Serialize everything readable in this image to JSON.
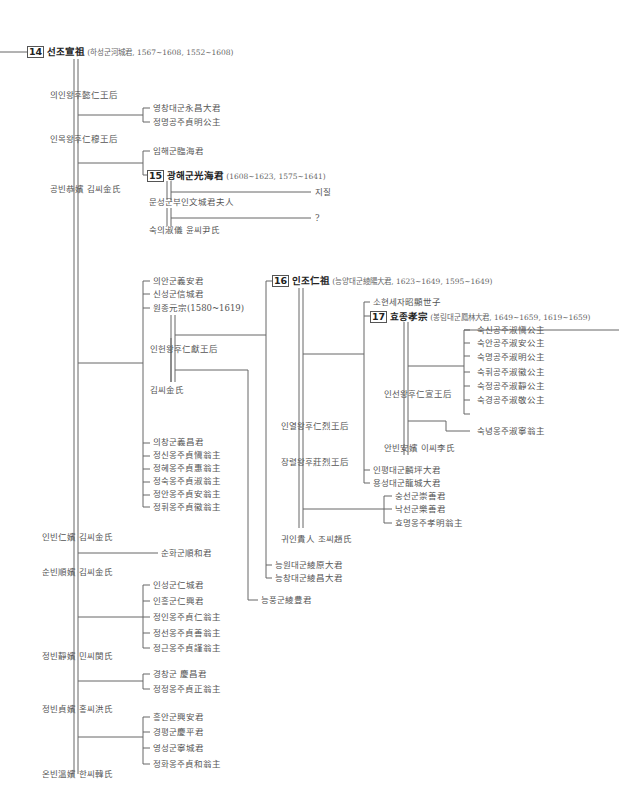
{
  "kings": {
    "seonjo": {
      "num": "14",
      "name": "선조宣祖",
      "info": "(하성군河城君, 1567~1608, 1552~1608)"
    },
    "gwanghaegun": {
      "num": "15",
      "name": "광해군光海君",
      "info": "(1608~1623, 1575~1641)"
    },
    "injo": {
      "num": "16",
      "name": "인조仁祖",
      "info": "(능양대군綾陽大君, 1623~1649, 1595~1649)"
    },
    "hyojong": {
      "num": "17",
      "name": "효종孝宗",
      "info": "(봉림대군鳳林大君, 1649~1659, 1619~1659)"
    }
  },
  "seonjo_consorts": [
    "의인왕후懿仁王后",
    "인목왕후仁穆王后",
    "공빈恭嬪 김씨金氏",
    "인빈仁嬪 김씨金氏",
    "순빈順嬪 김씨金氏",
    "정빈靜嬪 민씨閔氏",
    "정빈貞嬪 홍씨洪氏",
    "온빈溫嬪 한씨韓氏"
  ],
  "inmok_children": [
    "영창대군永昌大君",
    "정명공주貞明公主"
  ],
  "gongbin_children": [
    "임해군臨海君"
  ],
  "gwanghae_consorts": [
    "문성군부인文城君夫人",
    "숙의淑儀 윤씨尹氏"
  ],
  "gwanghae_children": [
    "지질",
    "?"
  ],
  "inbin_children_top": [
    "의안군義安君",
    "신성군信城君",
    "원종元宗(1580~1619)"
  ],
  "wonjong_consorts": [
    "인헌왕후仁獻王后",
    "김씨金氏"
  ],
  "inbin_children_bottom": [
    "의창군義昌君",
    "정신옹주貞愼翁主",
    "정혜옹주貞惠翁主",
    "정숙옹주貞淑翁主",
    "정안옹주貞安翁主",
    "정휘옹주貞徽翁主"
  ],
  "sunbin_children": [
    "순화군順和君"
  ],
  "jeongbin_min_children": [
    "인성군仁城君",
    "인흥군仁興君",
    "정인옹주貞仁翁主",
    "정선옹주貞善翁主",
    "정근옹주貞謹翁主"
  ],
  "jeongbin_hong_children": [
    "경창군 慶昌君",
    "정정옹주貞正翁主"
  ],
  "onbin_children": [
    "흥안군興安君",
    "경평군慶平君",
    "영성군寧城君",
    "정화옹주貞和翁主"
  ],
  "wonjong_children_kim": [
    "능풍군綾豊君"
  ],
  "injo_consorts": [
    "인열왕후仁烈王后",
    "장렬왕후莊烈王后",
    "귀인貴人 조씨趙氏"
  ],
  "injo_children": [
    "소현세자昭顯世子",
    "인평대군麟坪大君",
    "용성대군龍城大君"
  ],
  "inheon_children_extra": [
    "능원대군綾原大君",
    "능창대군綾昌大君"
  ],
  "gwiin_children": [
    "숭선군崇善君",
    "낙선군樂善君",
    "효명옹주孝明翁主"
  ],
  "hyojong_consorts": [
    "인선왕후仁宣王后",
    "안빈安嬪 이씨李氏"
  ],
  "inseon_children": [
    "숙신공주淑愼公主",
    "숙안공주淑安公主",
    "숙명공주淑明公主",
    "숙휘공주淑徽公主",
    "숙정공주淑靜公主",
    "숙경공주淑敬公主"
  ],
  "anbin_children": [
    "숙녕옹주淑寧翁主"
  ]
}
